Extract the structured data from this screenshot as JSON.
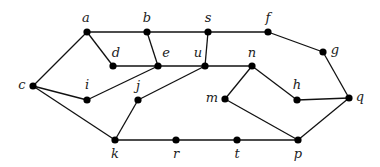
{
  "graph": {
    "nodes": [
      {
        "id": "a",
        "label": "a",
        "x": 87,
        "y": 32,
        "lx": 86,
        "ly": 22
      },
      {
        "id": "b",
        "label": "b",
        "x": 147,
        "y": 32,
        "lx": 147,
        "ly": 22
      },
      {
        "id": "s",
        "label": "s",
        "x": 208,
        "y": 32,
        "lx": 208,
        "ly": 22
      },
      {
        "id": "f",
        "label": "f",
        "x": 268,
        "y": 32,
        "lx": 268,
        "ly": 22
      },
      {
        "id": "g",
        "label": "g",
        "x": 323,
        "y": 52,
        "lx": 335,
        "ly": 54
      },
      {
        "id": "d",
        "label": "d",
        "x": 113,
        "y": 66,
        "lx": 116,
        "ly": 57
      },
      {
        "id": "e",
        "label": "e",
        "x": 158,
        "y": 66,
        "lx": 166,
        "ly": 57
      },
      {
        "id": "u",
        "label": "u",
        "x": 205,
        "y": 66,
        "lx": 198,
        "ly": 57
      },
      {
        "id": "n",
        "label": "n",
        "x": 252,
        "y": 66,
        "lx": 252,
        "ly": 57
      },
      {
        "id": "c",
        "label": "c",
        "x": 33,
        "y": 86,
        "lx": 22,
        "ly": 89
      },
      {
        "id": "i",
        "label": "i",
        "x": 87,
        "y": 100,
        "lx": 87,
        "ly": 89
      },
      {
        "id": "j",
        "label": "j",
        "x": 138,
        "y": 100,
        "lx": 138,
        "ly": 90
      },
      {
        "id": "m",
        "label": "m",
        "x": 225,
        "y": 99,
        "lx": 212,
        "ly": 102
      },
      {
        "id": "h",
        "label": "h",
        "x": 297,
        "y": 100,
        "lx": 297,
        "ly": 89
      },
      {
        "id": "q",
        "label": "q",
        "x": 349,
        "y": 98,
        "lx": 360,
        "ly": 101
      },
      {
        "id": "k",
        "label": "k",
        "x": 115,
        "y": 140,
        "lx": 115,
        "ly": 158
      },
      {
        "id": "r",
        "label": "r",
        "x": 176,
        "y": 140,
        "lx": 176,
        "ly": 158
      },
      {
        "id": "t",
        "label": "t",
        "x": 237,
        "y": 140,
        "lx": 237,
        "ly": 158
      },
      {
        "id": "p",
        "label": "p",
        "x": 298,
        "y": 140,
        "lx": 298,
        "ly": 158
      }
    ],
    "edges": [
      [
        "a",
        "b"
      ],
      [
        "b",
        "s"
      ],
      [
        "s",
        "f"
      ],
      [
        "f",
        "g"
      ],
      [
        "g",
        "q"
      ],
      [
        "a",
        "c"
      ],
      [
        "a",
        "d"
      ],
      [
        "d",
        "e"
      ],
      [
        "b",
        "e"
      ],
      [
        "s",
        "u"
      ],
      [
        "e",
        "u"
      ],
      [
        "u",
        "n"
      ],
      [
        "c",
        "i"
      ],
      [
        "i",
        "e"
      ],
      [
        "c",
        "k"
      ],
      [
        "k",
        "j"
      ],
      [
        "j",
        "u"
      ],
      [
        "k",
        "r"
      ],
      [
        "r",
        "t"
      ],
      [
        "t",
        "p"
      ],
      [
        "n",
        "m"
      ],
      [
        "n",
        "h"
      ],
      [
        "h",
        "q"
      ],
      [
        "m",
        "p"
      ],
      [
        "q",
        "p"
      ]
    ],
    "colors": {
      "edge": "#111111",
      "node": "#000000",
      "label": "#222222"
    }
  }
}
